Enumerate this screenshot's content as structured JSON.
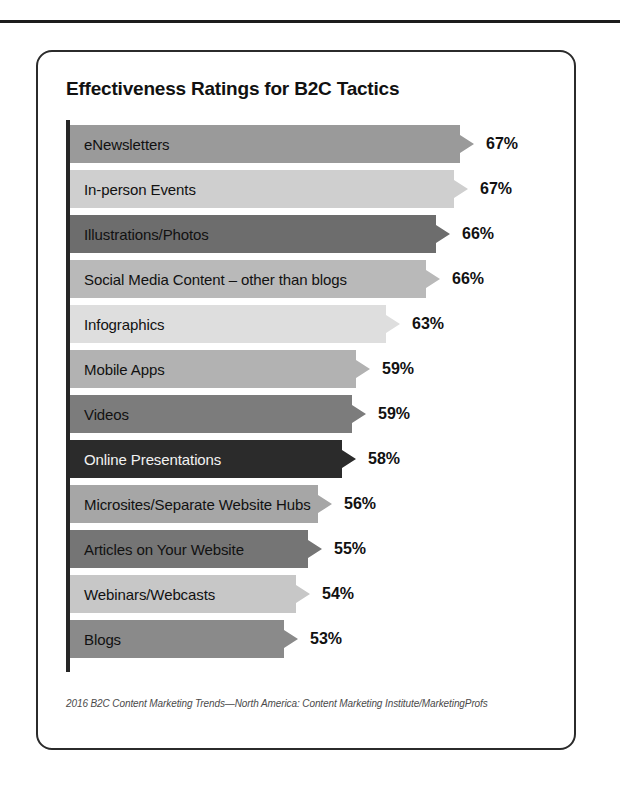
{
  "figure": {
    "title": "Effectiveness Ratings for B2C Tactics",
    "source_note": "2016 B2C Content Marketing Trends—North America: Content Marketing Institute/MarketingProfs"
  },
  "chart_data": {
    "type": "bar",
    "orientation": "horizontal",
    "title": "Effectiveness Ratings for B2C Tactics",
    "xlabel": "",
    "ylabel": "",
    "xlim": [
      0,
      70
    ],
    "grid": false,
    "legend": null,
    "value_suffix": "%",
    "categories": [
      "eNewsletters",
      "In-person Events",
      "Illustrations/Photos",
      "Social Media Content – other than blogs",
      "Infographics",
      "Mobile Apps",
      "Videos",
      "Online Presentations",
      "Microsites/Separate Website Hubs",
      "Articles on Your Website",
      "Webinars/Webcasts",
      "Blogs"
    ],
    "values": [
      67,
      67,
      66,
      66,
      63,
      59,
      59,
      58,
      56,
      55,
      54,
      53
    ],
    "value_labels": [
      "67%",
      "67%",
      "66%",
      "66%",
      "63%",
      "59%",
      "59%",
      "58%",
      "56%",
      "55%",
      "54%",
      "53%"
    ],
    "bar_colors": [
      "#9a9a9a",
      "#cfcfcf",
      "#6d6d6d",
      "#b9b9b9",
      "#dedede",
      "#b2b2b2",
      "#7c7c7c",
      "#2b2b2b",
      "#a6a6a6",
      "#757575",
      "#c7c7c7",
      "#8a8a8a"
    ],
    "bar_text_on_dark": [
      false,
      false,
      false,
      false,
      false,
      false,
      false,
      true,
      false,
      false,
      false,
      false
    ]
  },
  "bars": [
    {
      "label": "eNewsletters",
      "value_label": "67%",
      "width_px": 404,
      "color": "#9a9a9a",
      "dark": false
    },
    {
      "label": "In-person Events",
      "value_label": "67%",
      "width_px": 398,
      "color": "#cfcfcf",
      "dark": false
    },
    {
      "label": "Illustrations/Photos",
      "value_label": "66%",
      "width_px": 380,
      "color": "#6d6d6d",
      "dark": false
    },
    {
      "label": "Social Media Content – other than blogs",
      "value_label": "66%",
      "width_px": 370,
      "color": "#b9b9b9",
      "dark": false
    },
    {
      "label": "Infographics",
      "value_label": "63%",
      "width_px": 330,
      "color": "#dedede",
      "dark": false
    },
    {
      "label": "Mobile Apps",
      "value_label": "59%",
      "width_px": 300,
      "color": "#b2b2b2",
      "dark": false
    },
    {
      "label": "Videos",
      "value_label": "59%",
      "width_px": 296,
      "color": "#7c7c7c",
      "dark": false
    },
    {
      "label": "Online Presentations",
      "value_label": "58%",
      "width_px": 286,
      "color": "#2b2b2b",
      "dark": true
    },
    {
      "label": "Microsites/Separate Website Hubs",
      "value_label": "56%",
      "width_px": 262,
      "color": "#a6a6a6",
      "dark": false
    },
    {
      "label": "Articles on Your Website",
      "value_label": "55%",
      "width_px": 252,
      "color": "#757575",
      "dark": false
    },
    {
      "label": "Webinars/Webcasts",
      "value_label": "54%",
      "width_px": 240,
      "color": "#c7c7c7",
      "dark": false
    },
    {
      "label": "Blogs",
      "value_label": "53%",
      "width_px": 228,
      "color": "#8a8a8a",
      "dark": false
    }
  ]
}
